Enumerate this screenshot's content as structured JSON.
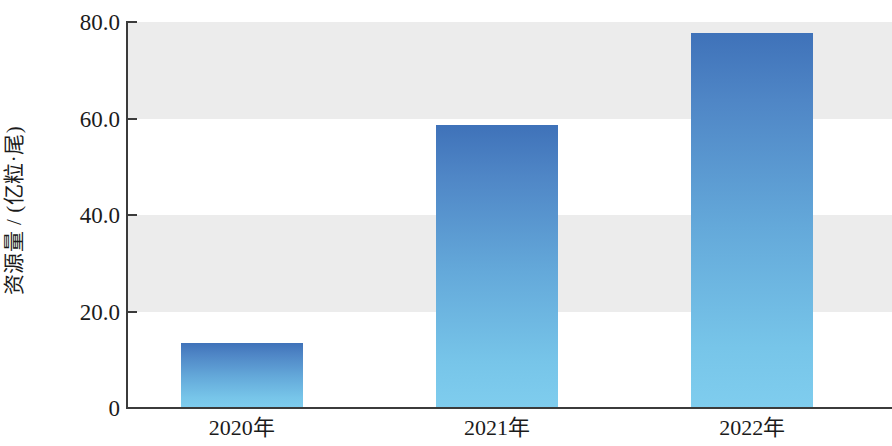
{
  "chart_data": {
    "type": "bar",
    "title": "",
    "subtitle": "",
    "xlabel": "",
    "ylabel": "资源量 / (亿粒·尾)",
    "categories": [
      "2020年",
      "2021年",
      "2022年"
    ],
    "values": [
      13.5,
      58.7,
      77.7
    ],
    "series": [
      {
        "name": "资源量",
        "values": [
          13.5,
          58.7,
          77.7
        ]
      }
    ],
    "ylim": [
      0,
      80
    ],
    "ytick_labels": [
      "0",
      "20.0",
      "40.0",
      "60.0",
      "80.0"
    ],
    "ytick_values": [
      0,
      20,
      40,
      60,
      80
    ],
    "grid": false,
    "legend": false,
    "legend_position": "none",
    "annotations": [],
    "bar_gradient_top_color": "#3f72b9",
    "bar_gradient_bottom_color": "#7fcdee",
    "band_color": "#ececec",
    "axis_color": "#3b3b3b",
    "background_color": "#ffffff",
    "banded_ranges": [
      [
        20,
        40
      ],
      [
        60,
        80
      ]
    ]
  }
}
